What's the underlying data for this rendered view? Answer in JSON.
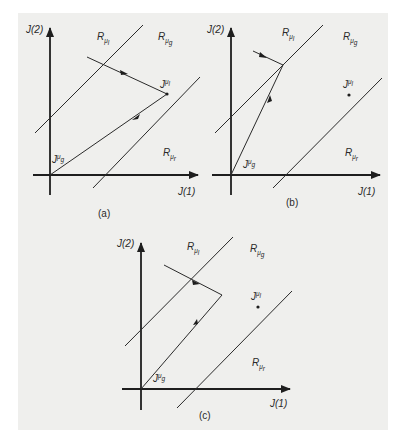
{
  "figure": {
    "background": "#efefed",
    "line_color": "#2a2a2a",
    "panels": [
      {
        "id": "a",
        "caption": "(a)",
        "x_axis_label": "J(1)",
        "y_axis_label": "J(2)",
        "regions": {
          "upper": {
            "main": "R",
            "sub": "μ",
            "subsub": "l"
          },
          "middle": {
            "main": "R",
            "sub": "μ",
            "subsub": "g"
          },
          "lower": {
            "main": "R",
            "sub": "μ",
            "subsub": "r"
          }
        },
        "points": {
          "local": {
            "main": "J",
            "sup": "μ",
            "supsub": "l"
          },
          "global": {
            "main": "J",
            "sup": "μ",
            "supsub": "g"
          }
        },
        "description": "Trajectory enters from region R_μl, reaches J^μl, then moves toward J^μg at origin"
      },
      {
        "id": "b",
        "caption": "(b)",
        "x_axis_label": "J(1)",
        "y_axis_label": "J(2)",
        "regions": {
          "upper": {
            "main": "R",
            "sub": "μ",
            "subsub": "l"
          },
          "middle": {
            "main": "R",
            "sub": "μ",
            "subsub": "g"
          },
          "lower": {
            "main": "R",
            "sub": "μ",
            "subsub": "r"
          }
        },
        "points": {
          "local": {
            "main": "J",
            "sup": "μ",
            "supsub": "l"
          },
          "global": {
            "main": "J",
            "sup": "μ",
            "supsub": "g"
          }
        },
        "description": "Trajectory reaches boundary line and turns toward J^μg"
      },
      {
        "id": "c",
        "caption": "(c)",
        "x_axis_label": "J(1)",
        "y_axis_label": "J(2)",
        "regions": {
          "upper": {
            "main": "R",
            "sub": "μ",
            "subsub": "l"
          },
          "middle": {
            "main": "R",
            "sub": "μ",
            "subsub": "g"
          },
          "lower": {
            "main": "R",
            "sub": "μ",
            "subsub": "r"
          }
        },
        "points": {
          "local": {
            "main": "J",
            "sup": "μ",
            "supsub": "l"
          },
          "global": {
            "main": "J",
            "sup": "μ",
            "supsub": "g"
          }
        },
        "description": "Trajectory crosses boundary into R_μg, turns and moves toward J^μg"
      }
    ]
  }
}
